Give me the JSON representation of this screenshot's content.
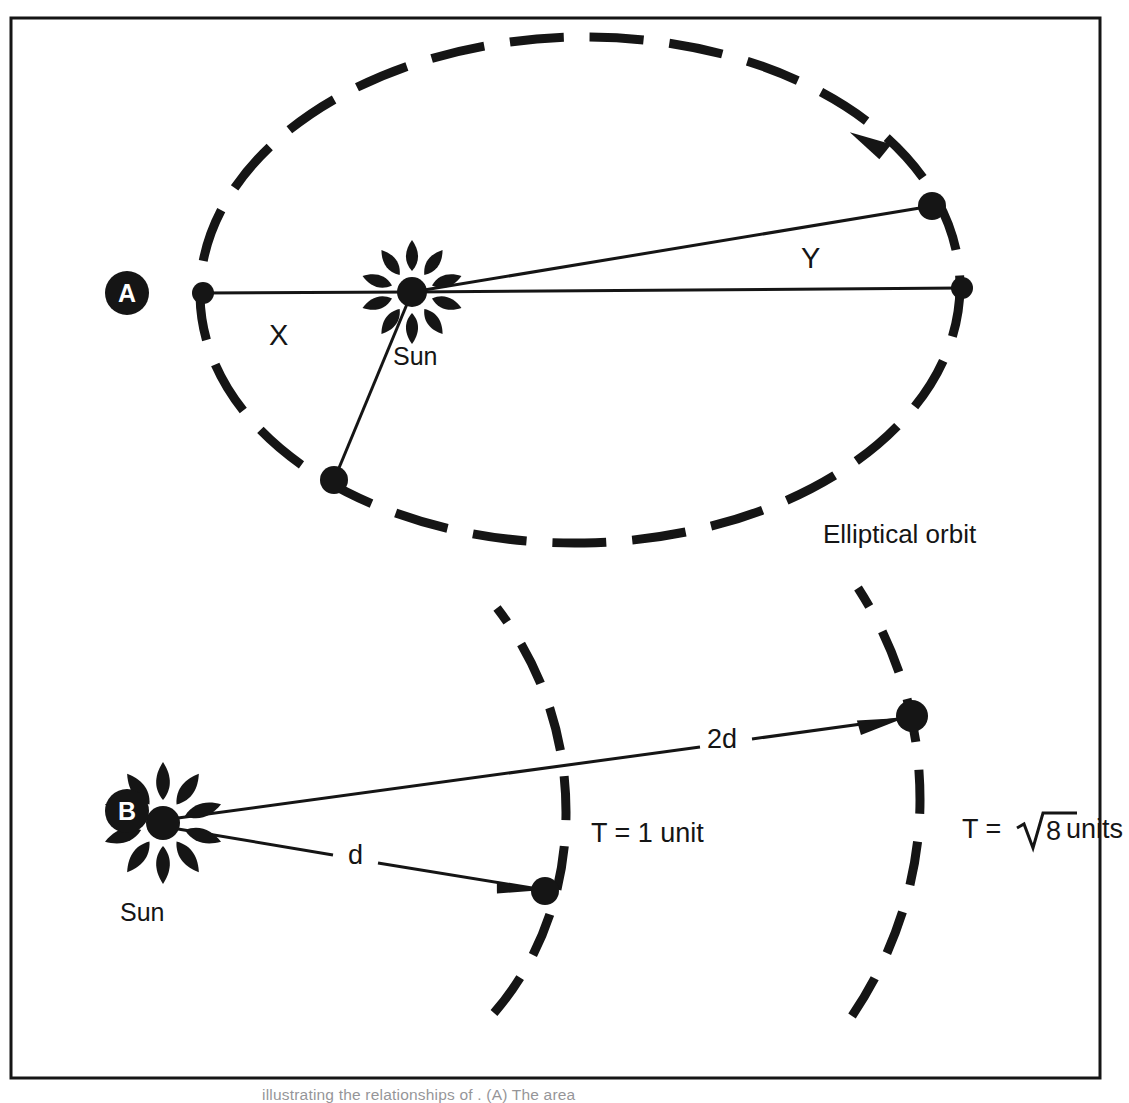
{
  "figure": {
    "background_color": "#ffffff",
    "ink_color": "#151515",
    "frame": {
      "x": 11,
      "y": 18,
      "width": 1089,
      "height": 1060,
      "stroke_width": 3
    },
    "caption_partial": "illustrating the relationships of . (A) The area"
  },
  "panels": [
    {
      "id": "A",
      "badge_label": "A",
      "badge": {
        "cx": 127,
        "cy": 293,
        "r": 22
      },
      "title": "Elliptical orbit diagram",
      "orbit": {
        "type": "ellipse",
        "cx": 580,
        "cy": 290,
        "rx": 380,
        "ry": 253,
        "style": "dashed",
        "dash_pattern": "54 26",
        "stroke_width": 9
      },
      "sun": {
        "cx": 412,
        "cy": 292,
        "core_r": 15,
        "ray_count": 10,
        "ray_length": 31,
        "label": "Sun",
        "label_x": 393,
        "label_y": 365
      },
      "bodies": [
        {
          "name": "aphelion-point",
          "cx": 203,
          "cy": 293,
          "r": 11
        },
        {
          "name": "perihelion-point",
          "cx": 962,
          "cy": 288,
          "r": 11
        },
        {
          "name": "sector-y-upper-point",
          "cx": 932,
          "cy": 206,
          "r": 14
        },
        {
          "name": "sector-x-lower-point",
          "cx": 334,
          "cy": 480,
          "r": 14
        }
      ],
      "sector_labels": [
        {
          "text": "X",
          "x": 269,
          "y": 345
        },
        {
          "text": "Y",
          "x": 801,
          "y": 268
        }
      ],
      "orbit_label": {
        "text": "Elliptical orbit",
        "x": 823,
        "y": 543
      },
      "direction_arrow": {
        "x": 880,
        "y": 148,
        "rotation": 28
      }
    },
    {
      "id": "B",
      "badge_label": "B",
      "badge": {
        "cx": 127,
        "cy": 811,
        "r": 22
      },
      "title": "Inverse square / period comparison diagram",
      "sun": {
        "cx": 163,
        "cy": 823,
        "core_r": 17,
        "ray_count": 10,
        "ray_length": 38,
        "label": "Sun",
        "label_x": 120,
        "label_y": 921
      },
      "arcs": [
        {
          "name": "inner-arc",
          "cx": -345,
          "cy": 800,
          "r": 900,
          "start_deg": -26,
          "end_deg": 26,
          "dash_pattern": "42 24",
          "stroke_width": 9
        },
        {
          "name": "outer-arc",
          "cx": -360,
          "cy": 800,
          "r": 1255,
          "start_deg": -19,
          "end_deg": 19,
          "dash_pattern": "42 26",
          "stroke_width": 9
        }
      ],
      "bodies": [
        {
          "name": "inner-planet",
          "cx": 545,
          "cy": 891,
          "r": 14
        },
        {
          "name": "outer-planet",
          "cx": 912,
          "cy": 716,
          "r": 16
        }
      ],
      "vectors": [
        {
          "name": "radius-vector-d",
          "label": "d",
          "label_x": 355,
          "label_y": 862,
          "x1": 178,
          "y1": 829,
          "x2": 538,
          "y2": 890
        },
        {
          "name": "radius-vector-2d",
          "label": "2d",
          "label_x": 722,
          "label_y": 746,
          "x1": 178,
          "y1": 818,
          "x2": 903,
          "y2": 718
        }
      ],
      "period_labels": [
        {
          "text": "T = 1 unit",
          "x": 591,
          "y": 842
        },
        {
          "text": "T = √8 units",
          "x": 962,
          "y": 838,
          "has_radical": true,
          "radical_over": "8",
          "prefix": "T = ",
          "suffix": " units"
        }
      ]
    }
  ],
  "chart_data": {
    "type": "diagram",
    "panel_a": {
      "concept": "Equal areas swept in equal times",
      "areas": [
        "X",
        "Y"
      ],
      "orbit_shape": "ellipse",
      "focus_occupant": "Sun",
      "orbit_label": "Elliptical orbit",
      "direction": "clockwise"
    },
    "panel_b": {
      "concept": "Period scales with orbital radius",
      "radii": [
        "d",
        "2d"
      ],
      "periods": [
        "T = 1 unit",
        "T = √8 units"
      ],
      "central_body": "Sun"
    }
  }
}
